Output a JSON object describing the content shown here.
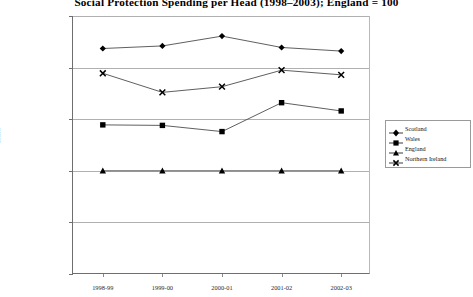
{
  "chart_data": {
    "type": "line",
    "title": "Social Protection Spending per Head (1998–2003); England = 100",
    "xlabel": "",
    "ylabel": "Index",
    "categories": [
      "1998-99",
      "1999-00",
      "2000-01",
      "2001-02",
      "2002-03"
    ],
    "ylim": [
      80,
      130
    ],
    "yticks": [
      80,
      90,
      100,
      110,
      120,
      130
    ],
    "grid": true,
    "legend_position": "right",
    "series": [
      {
        "name": "Scotland",
        "marker": "diamond",
        "values": [
          123.7,
          124.2,
          126.1,
          123.9,
          123.2
        ]
      },
      {
        "name": "Wales",
        "marker": "square",
        "values": [
          108.9,
          108.8,
          107.6,
          113.2,
          111.6
        ]
      },
      {
        "name": "England",
        "marker": "triangle",
        "values": [
          100.0,
          100.0,
          100.0,
          100.0,
          100.0
        ]
      },
      {
        "name": "Northern Ireland",
        "marker": "cross",
        "values": [
          118.9,
          115.2,
          116.3,
          119.5,
          118.6
        ]
      }
    ],
    "colors": {
      "line": "#4d4d4d",
      "marker": "#000000",
      "grid": "#b0b0b0",
      "axis": "#6e6e6e"
    }
  },
  "yticklabels": [
    "130",
    "120",
    "110",
    "100",
    "90",
    "80"
  ],
  "legend": {
    "items": [
      {
        "label": "Scotland"
      },
      {
        "label": "Wales"
      },
      {
        "label": "England"
      },
      {
        "label": "Northern Ireland"
      }
    ]
  }
}
